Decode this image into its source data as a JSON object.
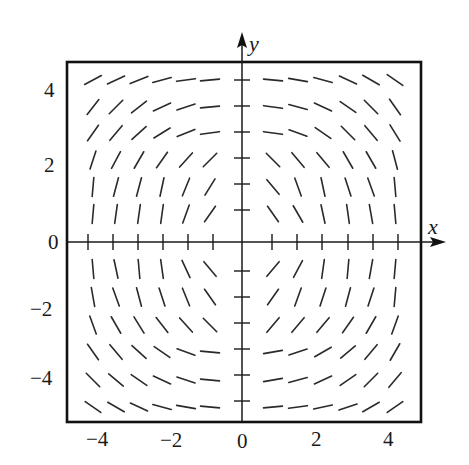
{
  "figure": {
    "type": "slope_field",
    "x_axis_label": "x",
    "y_axis_label": "y",
    "x_tick_labels": [
      {
        "text": "−4",
        "value": -4
      },
      {
        "text": "−2",
        "value": -2
      },
      {
        "text": "0",
        "value": 0
      },
      {
        "text": "2",
        "value": 2
      },
      {
        "text": "4",
        "value": 4
      }
    ],
    "y_tick_labels": [
      {
        "text": "4",
        "value": 4
      },
      {
        "text": "2",
        "value": 2
      },
      {
        "text": "0",
        "value": 0
      },
      {
        "text": "−2",
        "value": -2
      },
      {
        "text": "−4",
        "value": -4
      }
    ],
    "range": {
      "x": [
        -5,
        5
      ],
      "y": [
        -5,
        5
      ]
    },
    "grid_columns_per_side": 6,
    "grid_rows_per_side": 6,
    "segment_color": "#2a2a2a",
    "note": "Segments horizontal along y-axis, vertical along x-axis; slopes negative in quadrants I and III, positive in II and IV."
  },
  "slope_angles_deg": {
    "description": "Angle from horizontal of each segment (positive rises to the right). Rows listed top-to-bottom, columns left-to-right within each quadrant.",
    "top_left": [
      [
        28,
        25,
        22,
        15,
        8,
        5
      ],
      [
        52,
        45,
        38,
        25,
        18,
        5
      ],
      [
        55,
        50,
        42,
        32,
        22,
        8
      ],
      [
        72,
        62,
        60,
        55,
        48,
        45
      ],
      [
        85,
        75,
        75,
        78,
        68,
        58
      ],
      [
        85,
        82,
        82,
        82,
        70,
        55
      ]
    ],
    "top_right": [
      [
        -5,
        -10,
        -15,
        -25,
        -30,
        -35
      ],
      [
        -8,
        -15,
        -25,
        -35,
        -45,
        -55
      ],
      [
        -8,
        -20,
        -35,
        -45,
        -50,
        -58
      ],
      [
        -45,
        -50,
        -50,
        -60,
        -60,
        -75
      ],
      [
        -50,
        -70,
        -78,
        -72,
        -70,
        -85
      ],
      [
        -55,
        -60,
        -78,
        -82,
        -80,
        -85
      ]
    ],
    "bottom_left": [
      [
        -85,
        -78,
        -85,
        -82,
        -65,
        -50
      ],
      [
        -80,
        -70,
        -75,
        -72,
        -68,
        -55
      ],
      [
        -70,
        -60,
        -58,
        -52,
        -48,
        -45
      ],
      [
        -55,
        -50,
        -42,
        -35,
        -20,
        -5
      ],
      [
        -45,
        -40,
        -35,
        -25,
        -18,
        -5
      ],
      [
        -35,
        -30,
        -25,
        -15,
        -10,
        -5
      ]
    ],
    "bottom_right": [
      [
        50,
        62,
        82,
        85,
        80,
        85
      ],
      [
        55,
        70,
        72,
        75,
        72,
        85
      ],
      [
        50,
        50,
        50,
        55,
        60,
        70
      ],
      [
        10,
        18,
        30,
        40,
        50,
        60
      ],
      [
        10,
        15,
        25,
        35,
        45,
        50
      ],
      [
        5,
        8,
        12,
        18,
        30,
        35
      ]
    ]
  },
  "chart_data": {
    "type": "scatter",
    "title": "",
    "xlabel": "x",
    "ylabel": "y",
    "xlim": [
      -5,
      5
    ],
    "ylim": [
      -5,
      5
    ],
    "xticks": [
      -4,
      -2,
      0,
      2,
      4
    ],
    "yticks": [
      -4,
      -2,
      0,
      2,
      4
    ],
    "grid": false,
    "legend": null,
    "kind": "slope field (direction field), 12x12 segments; horizontal on y-axis, vertical on x-axis"
  }
}
